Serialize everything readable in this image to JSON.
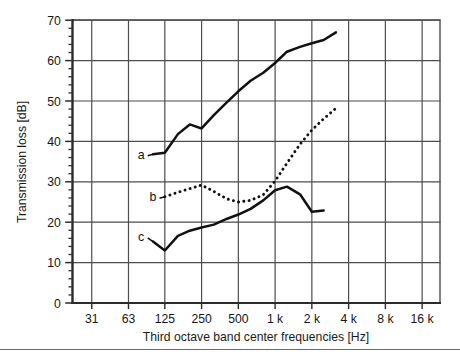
{
  "figure": {
    "title": "",
    "background_color": "#ffffff",
    "frame_color": "#6e6e6e"
  },
  "axes": {
    "y_title": "Transmission loss  [dB]",
    "x_title": "Third octave band center frequencies  [Hz]",
    "y_ticks": [
      "0",
      "10",
      "20",
      "30",
      "40",
      "50",
      "60",
      "70"
    ],
    "x_ticks": [
      "31",
      "63",
      "125",
      "250",
      "500",
      "1 k",
      "2 k",
      "4 k",
      "8 k",
      "16 k"
    ],
    "grid_color": "#4d4d4d",
    "line_color": "#111111"
  },
  "curve_labels": {
    "a": "a",
    "b": "b",
    "c": "c"
  },
  "chart_data": {
    "type": "line",
    "title": "",
    "xlabel": "Third octave band center frequencies  [Hz]",
    "ylabel": "Transmission loss  [dB]",
    "xscale": "log",
    "x_tick_labels": [
      "31",
      "63",
      "125",
      "250",
      "500",
      "1 k",
      "2 k",
      "4 k",
      "8 k",
      "16 k"
    ],
    "x_tick_values": [
      31.5,
      63,
      125,
      250,
      500,
      1000,
      2000,
      4000,
      8000,
      16000
    ],
    "y_tick_values": [
      0,
      10,
      20,
      30,
      40,
      50,
      60,
      70
    ],
    "ylim": [
      0,
      70
    ],
    "xlim": [
      22,
      22627
    ],
    "grid": true,
    "legend": "inline labels a, b, c",
    "series": [
      {
        "name": "a",
        "label": "a",
        "style": "solid",
        "x": [
          100,
          125,
          160,
          200,
          250,
          315,
          400,
          500,
          630,
          800,
          1000,
          1250,
          1600,
          2000,
          2500,
          3150
        ],
        "y": [
          36.8,
          37.2,
          41.8,
          44.2,
          43.2,
          46.5,
          49.6,
          52.4,
          55.0,
          57.0,
          59.4,
          62.2,
          63.4,
          64.3,
          65.1,
          67.0
        ]
      },
      {
        "name": "b",
        "label": "b",
        "style": "dotted",
        "x": [
          125,
          160,
          200,
          250,
          315,
          400,
          500,
          630,
          800,
          1000,
          1250,
          1600,
          2000,
          2500,
          3150
        ],
        "y": [
          26.3,
          27.4,
          28.3,
          29.2,
          27.6,
          25.8,
          25.0,
          25.4,
          26.8,
          30.2,
          34.6,
          39.3,
          42.8,
          45.6,
          48.2
        ]
      },
      {
        "name": "c",
        "label": "c",
        "style": "solid",
        "x": [
          100,
          125,
          160,
          200,
          250,
          315,
          400,
          500,
          630,
          800,
          1000,
          1250,
          1600,
          2000,
          2500
        ],
        "y": [
          15.2,
          13.0,
          16.6,
          17.9,
          18.7,
          19.4,
          20.8,
          21.9,
          23.3,
          25.4,
          27.9,
          28.8,
          26.9,
          22.6,
          22.9
        ]
      }
    ],
    "annotations": [
      {
        "text": "a",
        "x": 80,
        "y": 36.8
      },
      {
        "text": "b",
        "x": 100,
        "y": 26.3
      },
      {
        "text": "c",
        "x": 80,
        "y": 16.5
      }
    ]
  }
}
